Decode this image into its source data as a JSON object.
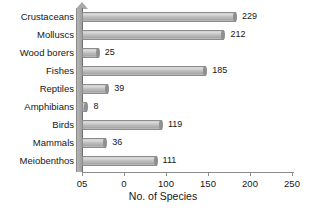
{
  "chart_data": {
    "type": "bar",
    "orientation": "horizontal",
    "title": "",
    "xlabel": "No. of Species",
    "ylabel": "",
    "categories": [
      "Crustaceans",
      "Molluscs",
      "Wood borers",
      "Fishes",
      "Reptiles",
      "Amphibians",
      "Birds",
      "Mammals",
      "Meiobenthos"
    ],
    "values": [
      229,
      212,
      25,
      185,
      39,
      8,
      119,
      36,
      111
    ],
    "xlim": [
      0,
      250
    ],
    "xticks": [
      0,
      0,
      100,
      150,
      200,
      250
    ],
    "xtick_labels": [
      "05",
      "0",
      "100",
      "150",
      "200",
      "250"
    ],
    "grid": false,
    "legend": false,
    "data_labels": [
      "229",
      "212",
      "25",
      "185",
      "39",
      "8",
      "119",
      "36",
      "111"
    ],
    "bar_color": "#c2c2c2",
    "bar_edge_color": "#8c8c8c",
    "axis_color": "#8d8d8d",
    "background": "#ffffff"
  }
}
